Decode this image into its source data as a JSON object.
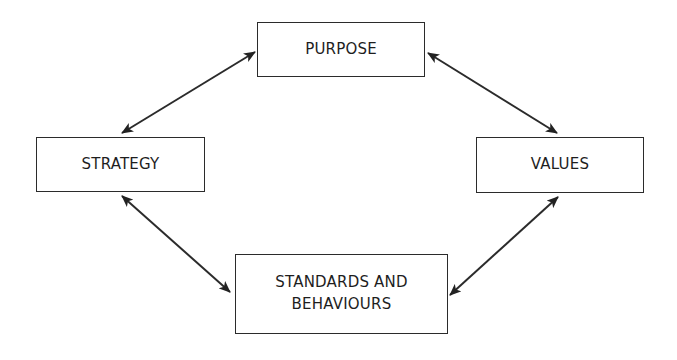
{
  "diagram": {
    "type": "cycle",
    "nodes": [
      {
        "id": "purpose",
        "label": "PURPOSE",
        "lines": [
          "PURPOSE"
        ],
        "box": {
          "x": 257,
          "y": 22,
          "w": 168,
          "h": 55
        }
      },
      {
        "id": "values",
        "label": "VALUES",
        "lines": [
          "VALUES"
        ],
        "box": {
          "x": 476,
          "y": 137,
          "w": 168,
          "h": 56
        }
      },
      {
        "id": "standards",
        "label": "STANDARDS AND BEHAVIOURS",
        "lines": [
          "STANDARDS AND",
          "BEHAVIOURS"
        ],
        "box": {
          "x": 235,
          "y": 254,
          "w": 213,
          "h": 80
        }
      },
      {
        "id": "strategy",
        "label": "STRATEGY",
        "lines": [
          "STRATEGY"
        ],
        "box": {
          "x": 36,
          "y": 137,
          "w": 169,
          "h": 55
        }
      }
    ],
    "edges": [
      {
        "from": "strategy",
        "to": "purpose",
        "direction": "bidirectional",
        "p1": [
          122,
          133
        ],
        "p2": [
          255,
          52
        ]
      },
      {
        "from": "purpose",
        "to": "values",
        "direction": "bidirectional",
        "p1": [
          428,
          53
        ],
        "p2": [
          557,
          133
        ]
      },
      {
        "from": "values",
        "to": "standards",
        "direction": "bidirectional",
        "p1": [
          558,
          197
        ],
        "p2": [
          450,
          295
        ]
      },
      {
        "from": "standards",
        "to": "strategy",
        "direction": "bidirectional",
        "p1": [
          230,
          292
        ],
        "p2": [
          122,
          196
        ]
      }
    ],
    "colors": {
      "stroke": "#2b2b2b",
      "text": "#1e1e1e",
      "background": "#ffffff"
    }
  }
}
